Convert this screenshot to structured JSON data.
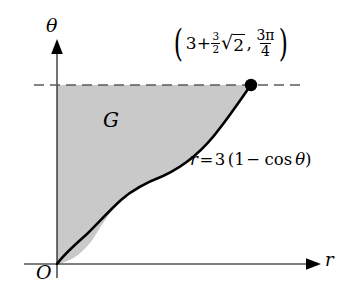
{
  "figure": {
    "kind": "polar-curve-region-diagram",
    "background_color": "#ffffff",
    "ink_color": "#000000",
    "shade_color": "#c9c9c9"
  },
  "axes": {
    "horizontal": {
      "name": "r-axis",
      "label": "r",
      "arrow": "right"
    },
    "vertical": {
      "name": "theta-axis",
      "label": "θ",
      "arrow": "up"
    },
    "origin": {
      "label": "O"
    }
  },
  "region": {
    "label": "G",
    "fill_color": "#c9c9c9"
  },
  "curve": {
    "equation_parts": {
      "lhs": "r",
      "equals": "=",
      "coefficient": "3",
      "open": "(",
      "one": "1",
      "minus": "−",
      "cos": "cos",
      "variable": "θ",
      "close": ")"
    },
    "equation_text": "r = 3 (1 − cos θ)"
  },
  "point_label": {
    "open_paren": "(",
    "close_paren": ")",
    "x_integer": "3",
    "x_plus": "+",
    "x_fraction": {
      "numerator": "3",
      "denominator": "2"
    },
    "x_radical_sign": "√",
    "x_radicand": "2",
    "separator": ",",
    "y_fraction": {
      "numerator": "3π",
      "denominator": "4"
    },
    "full_text": "(3 + (3/2)√2 , 3π/4)"
  },
  "dashed_line": {
    "name": "theta-level-guide",
    "dash_pattern": "10 6"
  },
  "marker": {
    "name": "endpoint-dot"
  }
}
